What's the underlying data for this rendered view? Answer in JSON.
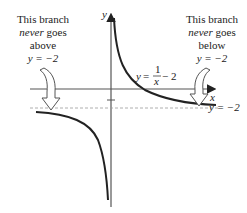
{
  "diagram": {
    "axes": {
      "x_label": "x",
      "y_label": "y"
    },
    "curve": {
      "equation_lhs": "y",
      "equation_eq": " = ",
      "numerator": "1",
      "denominator": "x",
      "equation_tail": " − 2"
    },
    "asymptote_label": "y = −2",
    "left_note": {
      "line1": "This branch",
      "line2_italic": "never",
      "line2_rest": " goes",
      "line3": "above",
      "line4": "y = −2"
    },
    "right_note": {
      "line1": "This branch",
      "line2_italic": "never",
      "line2_rest": " goes",
      "line3": "below",
      "line4": "y = −2"
    },
    "colors": {
      "curve": "#222222",
      "axis": "#333333",
      "asymptote": "#888888",
      "arrow_outline": "#555555"
    }
  }
}
